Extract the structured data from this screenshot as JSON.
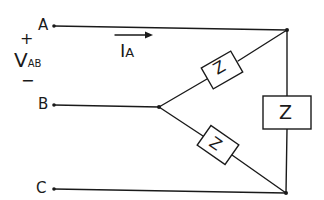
{
  "diagram": {
    "title": "",
    "terminals": [
      {
        "id": "A",
        "label": "A"
      },
      {
        "id": "B",
        "label": "B"
      },
      {
        "id": "C",
        "label": "C"
      }
    ],
    "voltage": {
      "plus": "+",
      "minus": "−",
      "symbol": "V",
      "subscript": "AB"
    },
    "current": {
      "symbol": "I",
      "subscript": "A"
    },
    "impedances": [
      {
        "id": "Z_AB_leg",
        "label": "Z"
      },
      {
        "id": "Z_BC_leg",
        "label": "Z"
      },
      {
        "id": "Z_AC_leg",
        "label": "Z"
      }
    ],
    "colors": {
      "ink": "#1a1a1a",
      "background": "#ffffff"
    }
  }
}
